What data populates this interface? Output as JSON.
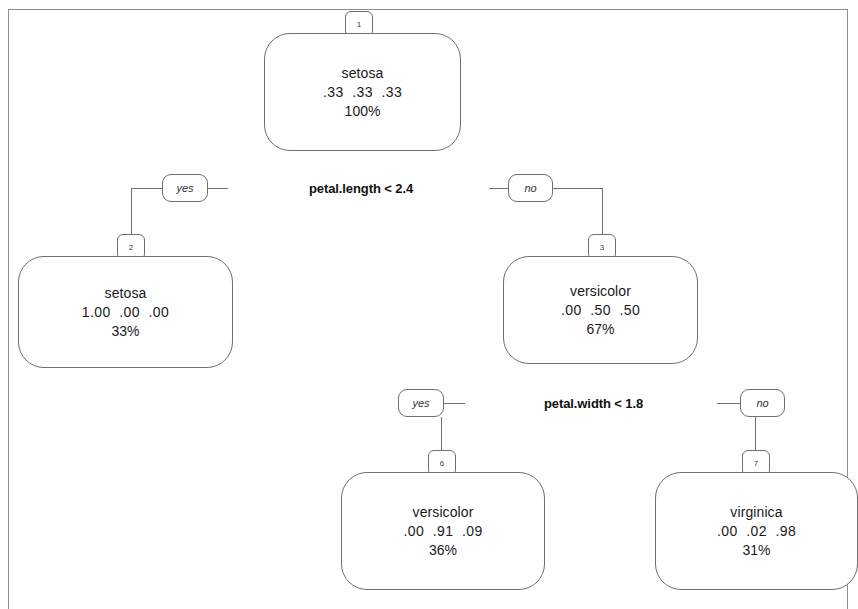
{
  "figure": {
    "type": "decision-tree",
    "model": "rpart classification tree",
    "dataset_classes": [
      "setosa",
      "versicolor",
      "virginica"
    ],
    "frame_color": "#8d8d8d",
    "node_outline_color": "#6f6f6f",
    "text_color": "#1a1a1a"
  },
  "nodes": [
    {
      "id": "1",
      "badge": "1",
      "class_label": "setosa",
      "probs_text": ".33  .33  .33",
      "probs": [
        0.33,
        0.33,
        0.33
      ],
      "pct_text": "100%",
      "pct": 100
    },
    {
      "id": "2",
      "badge": "2",
      "class_label": "setosa",
      "probs_text": "1.00  .00  .00",
      "probs": [
        1.0,
        0.0,
        0.0
      ],
      "pct_text": "33%",
      "pct": 33
    },
    {
      "id": "3",
      "badge": "3",
      "class_label": "versicolor",
      "probs_text": ".00  .50  .50",
      "probs": [
        0.0,
        0.5,
        0.5
      ],
      "pct_text": "67%",
      "pct": 67
    },
    {
      "id": "6",
      "badge": "6",
      "class_label": "versicolor",
      "probs_text": ".00  .91  .09",
      "probs": [
        0.0,
        0.91,
        0.09
      ],
      "pct_text": "36%",
      "pct": 36
    },
    {
      "id": "7",
      "badge": "7",
      "class_label": "virginica",
      "probs_text": ".00  .02  .98",
      "probs": [
        0.0,
        0.02,
        0.98
      ],
      "pct_text": "31%",
      "pct": 31
    }
  ],
  "splits": [
    {
      "id": "split-1",
      "label": "petal.length < 2.4",
      "variable": "petal.length",
      "operator": "<",
      "threshold": 2.4,
      "yes_label": "yes",
      "no_label": "no",
      "yes_child": "2",
      "no_child": "3"
    },
    {
      "id": "split-3",
      "label": "petal.width < 1.8",
      "variable": "petal.width",
      "operator": "<",
      "threshold": 1.8,
      "yes_label": "yes",
      "no_label": "no",
      "yes_child": "6",
      "no_child": "7"
    }
  ]
}
